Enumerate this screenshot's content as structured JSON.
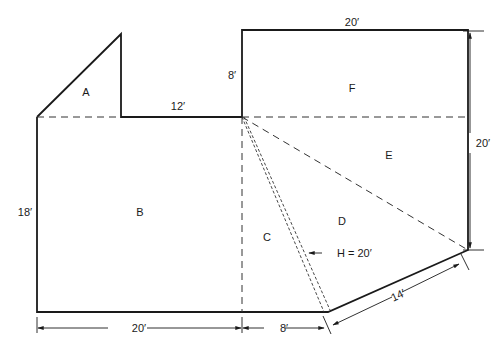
{
  "diagram": {
    "type": "floor-plan-area-decomposition",
    "regions": [
      {
        "id": "A",
        "label": "A",
        "shape": "triangle"
      },
      {
        "id": "B",
        "label": "B",
        "shape": "rectangle"
      },
      {
        "id": "C",
        "label": "C",
        "shape": "triangle"
      },
      {
        "id": "D",
        "label": "D",
        "shape": "triangle"
      },
      {
        "id": "E",
        "label": "E",
        "shape": "triangle"
      },
      {
        "id": "F",
        "label": "F",
        "shape": "rectangle"
      }
    ],
    "dimensions": {
      "top_right_width": "20′",
      "upper_step_height": "8′",
      "ledge_width": "12′",
      "left_height": "18′",
      "right_height": "20′",
      "bottom_left_width": "20′",
      "bottom_mid_width": "8′",
      "diagonal_length": "14′",
      "height_annotation": "H = 20′"
    },
    "colors": {
      "stroke": "#1a1a1a",
      "background": "#ffffff"
    }
  }
}
